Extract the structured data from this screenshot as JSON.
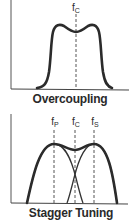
{
  "panels": [
    {
      "title": "Overcoupling",
      "markers": [
        {
          "base": "f",
          "sub": "C"
        }
      ]
    },
    {
      "title": "Stagger Tuning",
      "markers": [
        {
          "base": "f",
          "sub": "P"
        },
        {
          "base": "f",
          "sub": "C"
        },
        {
          "base": "f",
          "sub": "S"
        }
      ]
    }
  ],
  "colors": {
    "curve": "#2b2b2b",
    "axis": "#444444",
    "dashed": "#555555",
    "background": "#ffffff"
  }
}
